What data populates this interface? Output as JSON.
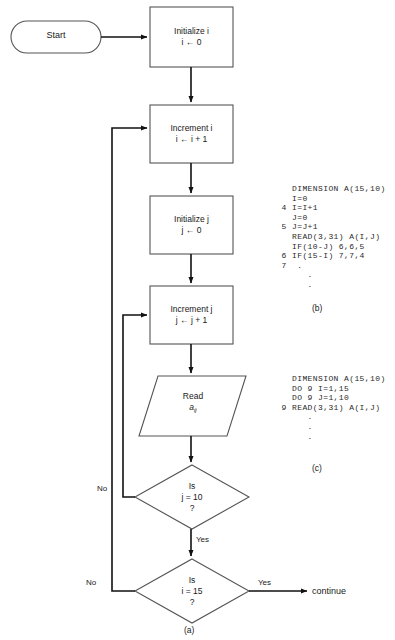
{
  "figure": {
    "caption_a": "(a)",
    "caption_b": "(b)",
    "caption_c": "(c)"
  },
  "flowchart": {
    "start": {
      "label": "Start",
      "shape": "terminator"
    },
    "nodes": [
      {
        "id": "init-i",
        "shape": "process",
        "line1": "Initialize i",
        "line2": "i ← 0"
      },
      {
        "id": "increment-i",
        "shape": "process",
        "line1": "Increment i",
        "line2": "i ← i + 1"
      },
      {
        "id": "init-j",
        "shape": "process",
        "line1": "Initialize j",
        "line2": "j ← 0"
      },
      {
        "id": "increment-j",
        "shape": "process",
        "line1": "Increment j",
        "line2": "j ← j + 1"
      },
      {
        "id": "read-aij",
        "shape": "input-output",
        "line1": "Read",
        "line2": "a",
        "line2_sub": "ij"
      },
      {
        "id": "decision-j",
        "shape": "decision",
        "line1": "Is",
        "line2": "j = 10",
        "line3": "?"
      },
      {
        "id": "decision-i",
        "shape": "decision",
        "line1": "Is",
        "line2": "i = 15",
        "line3": "?"
      }
    ],
    "edge_labels": {
      "j_no": "No",
      "j_yes": "Yes",
      "i_no": "No",
      "i_yes": "Yes"
    },
    "exit": {
      "label": "continue"
    }
  },
  "code_b": {
    "lines": [
      "     DIMENSION A(15,10)",
      "     I=0",
      "   4 I=I+1",
      "     J=0",
      "   5 J=J+1",
      "     READ(3,31) A(I,J)",
      "     IF(10-J) 6,6,5",
      "   6 IF(15-I) 7,7,4",
      "   7  .",
      "        .",
      "        ."
    ]
  },
  "code_c": {
    "lines": [
      "     DIMENSION A(15,10)",
      "     DO 9 I=1,15",
      "     DO 9 J=1,10",
      "   9 READ(3,31) A(I,J)",
      "        .",
      "        .",
      "        ."
    ]
  },
  "colors": {
    "stroke": "#555555",
    "arrow": "#111111",
    "text": "#1a1a1a",
    "background": "#ffffff"
  }
}
